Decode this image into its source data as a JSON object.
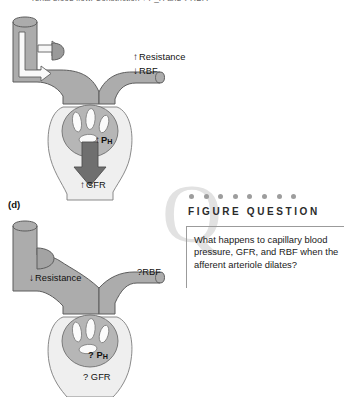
{
  "page": {
    "cropped_top_text": "renal blood flow. Constriction ↑ P_H and ↓ RBF."
  },
  "panel_c": {
    "letter": "",
    "resistance_label": "Resistance",
    "resistance_arrow": "up",
    "rbf_label": "RBF",
    "rbf_arrow": "down",
    "ph_label": "P",
    "ph_subscript": "H",
    "ph_arrow": "up",
    "gfr_label": "GFR",
    "gfr_arrow": "up",
    "state": "afferent arteriole constricted"
  },
  "panel_d": {
    "letter": "(d)",
    "resistance_label": "Resistance",
    "resistance_arrow": "down",
    "rbf_label": "?RBF",
    "ph_prefix": "?",
    "ph_label": "P",
    "ph_subscript": "H",
    "gfr_label": "? GFR",
    "state": "afferent arteriole dilated"
  },
  "figure_question": {
    "watermark": "Q",
    "dot_count": 8,
    "title": "FIGURE QUESTION",
    "body": "What happens to capillary blood pressure, GFR, and RBF when the afferent arteriole dilates?"
  },
  "colors": {
    "vessel_gray": "#a9a9a9",
    "vessel_stroke": "#5b5b5b",
    "capsule_light": "#ededed",
    "tuft_gray": "#b4b4b4",
    "arrow_dark": "#6e6e6e",
    "dot_gray": "#9d9d9d",
    "watermark_gray": "#e2e2e2",
    "text_black": "#111111"
  }
}
